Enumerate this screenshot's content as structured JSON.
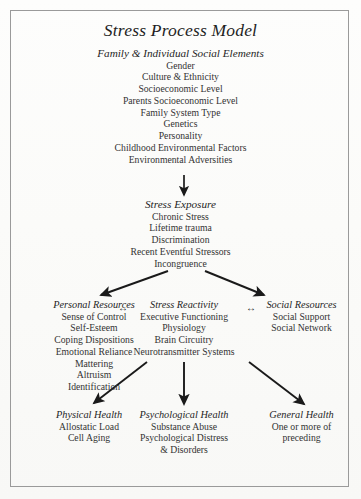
{
  "figure": {
    "title": "Stress Process Model",
    "border_color": "#9a9a9a",
    "background_color": "#fdfdfb",
    "text_color": "#2b2b2b",
    "arrow_color": "#1a1a1a"
  },
  "levels": {
    "inputs": {
      "header": "Family & Individual Social Elements",
      "items": [
        "Gender",
        "Culture & Ethnicity",
        "Socioeconomic Level",
        "Parents Socioeconomic Level",
        "Family System Type",
        "Genetics",
        "Personality",
        "Childhood Environmental Factors",
        "Environmental Adversities"
      ]
    },
    "exposure": {
      "header": "Stress Exposure",
      "items": [
        "Chronic Stress",
        "Lifetime trauma",
        "Discrimination",
        "Recent Eventful Stressors",
        "Incongruence"
      ]
    },
    "mediators": {
      "personal": {
        "header": "Personal Resources",
        "items": [
          "Sense of Control",
          "Self-Esteem",
          "Coping Dispositions",
          "Emotional Reliance",
          "Mattering",
          "Altruism",
          "Identification"
        ]
      },
      "reactivity": {
        "header": "Stress Reactivity",
        "items": [
          "Executive Functioning",
          "Physiology",
          "Brain Circuitry",
          "Neurotransmitter Systems"
        ]
      },
      "social": {
        "header": "Social Resources",
        "items": [
          "Social Support",
          "Social Network"
        ]
      },
      "link_left": "↔",
      "link_right": "↔"
    },
    "outcomes": {
      "physical": {
        "header": "Physical Health",
        "items": [
          "Allostatic Load",
          "Cell Aging"
        ]
      },
      "psychological": {
        "header": "Psychological Health",
        "items": [
          "Substance Abuse",
          "Psychological Distress",
          "& Disorders"
        ]
      },
      "general": {
        "header": "General Health",
        "items": [
          "One or more of",
          "preceding"
        ]
      }
    }
  }
}
